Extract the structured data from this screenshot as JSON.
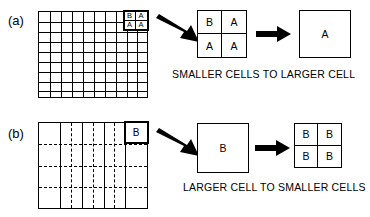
{
  "figure": {
    "rows": [
      {
        "label": "(a)",
        "caption": "SMALLER CELLS TO LARGER CELL",
        "source_grid": {
          "type": "fine",
          "columns": 10,
          "rows": 9,
          "line_style": "solid",
          "highlight": {
            "position": "top-right",
            "columns": 2,
            "rows": 2,
            "values": [
              "B",
              "A",
              "A",
              "A"
            ]
          }
        },
        "intermediate_box": {
          "type": "2x2",
          "values": [
            "B",
            "A",
            "A",
            "A"
          ]
        },
        "final_box": {
          "type": "single",
          "value": "A"
        },
        "arrows": [
          "angled-right-down",
          "horizontal-right"
        ]
      },
      {
        "label": "(b)",
        "caption": "LARGER CELL TO SMALLER CELLS",
        "source_grid": {
          "type": "coarse",
          "columns": 5,
          "rows": 4,
          "line_style": "dash-dot",
          "highlight": {
            "position": "top-right",
            "columns": 1,
            "rows": 1,
            "values": [
              "B"
            ]
          }
        },
        "intermediate_box": {
          "type": "single",
          "value": "B"
        },
        "final_box": {
          "type": "2x2",
          "values": [
            "B",
            "B",
            "B",
            "B"
          ]
        },
        "arrows": [
          "angled-right-down",
          "horizontal-right"
        ]
      }
    ],
    "colors": {
      "stroke": "#000000",
      "background": "#ffffff"
    }
  }
}
